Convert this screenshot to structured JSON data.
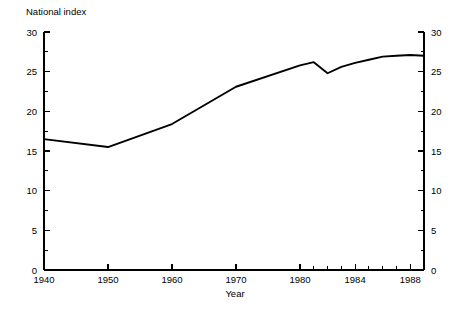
{
  "chart_data": {
    "type": "line",
    "title": "",
    "ylabel": "National index",
    "xlabel": "Year",
    "ylim": [
      0,
      30
    ],
    "y_ticks_major": [
      0,
      5,
      10,
      15,
      20,
      25,
      30
    ],
    "y_ticks_minor": [
      2.5,
      7.5,
      12.5,
      17.5,
      22.5,
      27.5
    ],
    "y_tick_labels": [
      "0",
      "5",
      "10",
      "15",
      "20",
      "25",
      "30"
    ],
    "x_tick_labels": [
      "1940",
      "1950",
      "1960",
      "1970",
      "1980",
      "1984",
      "1988"
    ],
    "x_ticks_labeled": [
      1940,
      1950,
      1960,
      1970,
      1980,
      1984,
      1988
    ],
    "x_ticks_all": [
      1940,
      1950,
      1960,
      1970,
      1980,
      1981,
      1982,
      1983,
      1984,
      1985,
      1986,
      1987,
      1988,
      1989
    ],
    "x_axis_note": "broken-scale: decades 1940-1980 evenly spaced, then individual years 1980-1989",
    "grid": false,
    "legend": false,
    "right_axis_mirrored": true,
    "line_color": "#000000",
    "series": [
      {
        "name": "National index",
        "x": [
          1940,
          1950,
          1960,
          1970,
          1980,
          1981,
          1982,
          1983,
          1984,
          1985,
          1986,
          1987,
          1988,
          1989
        ],
        "values": [
          16.5,
          15.5,
          18.4,
          23.1,
          25.8,
          26.2,
          24.8,
          25.6,
          26.1,
          26.5,
          26.9,
          27.0,
          27.1,
          27.0
        ]
      }
    ]
  },
  "labels": {
    "y_axis_title": "National index",
    "x_axis_title": "Year"
  }
}
